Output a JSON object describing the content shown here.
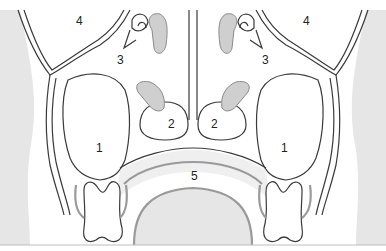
{
  "figure": {
    "type": "anatomical-diagram",
    "labels": [
      {
        "id": "left-1",
        "text": "1",
        "x": 99,
        "y": 152
      },
      {
        "id": "right-1",
        "text": "1",
        "x": 284,
        "y": 152
      },
      {
        "id": "left-2",
        "text": "2",
        "x": 172,
        "y": 128
      },
      {
        "id": "right-2",
        "text": "2",
        "x": 214,
        "y": 128
      },
      {
        "id": "left-3",
        "text": "3",
        "x": 121,
        "y": 64
      },
      {
        "id": "right-3",
        "text": "3",
        "x": 265,
        "y": 64
      },
      {
        "id": "left-4",
        "text": "4",
        "x": 79,
        "y": 25
      },
      {
        "id": "right-4",
        "text": "4",
        "x": 306,
        "y": 25
      },
      {
        "id": "center-5",
        "text": "5",
        "x": 195,
        "y": 179
      }
    ],
    "colors": {
      "background": "#ffffff",
      "soft_tissue": "#e6e6e6",
      "mucosa": "#cfcfcf",
      "outline": "#3a3a3a",
      "gum_line": "#9a9a9a"
    }
  }
}
